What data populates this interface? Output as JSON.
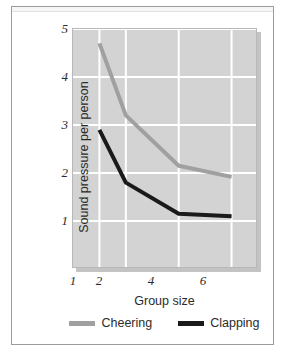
{
  "chart_data": {
    "type": "line",
    "title": "",
    "xlabel": "Group size",
    "ylabel": "Sound pressure per person",
    "x": [
      1,
      2,
      4,
      6
    ],
    "xtick_labels": [
      "1",
      "2",
      "4",
      "6"
    ],
    "ytick_labels": [
      "5",
      "4",
      "3",
      "2",
      "1"
    ],
    "xlim": [
      0,
      7
    ],
    "ylim": [
      0,
      5
    ],
    "grid": "both",
    "legend_position": "below-axes",
    "series": [
      {
        "name": "Cheering",
        "color": "#a0a0a0",
        "values": [
          4.7,
          3.2,
          2.15,
          1.92
        ]
      },
      {
        "name": "Clapping",
        "color": "#1a1a1a",
        "values": [
          2.9,
          1.8,
          1.15,
          1.1
        ]
      }
    ]
  },
  "axes": {
    "y_ticks": [
      {
        "label": "5",
        "value": 5
      },
      {
        "label": "4",
        "value": 4
      },
      {
        "label": "3",
        "value": 3
      },
      {
        "label": "2",
        "value": 2
      },
      {
        "label": "1",
        "value": 1
      }
    ],
    "x_ticks": [
      {
        "label": "1",
        "value": 1
      },
      {
        "label": "2",
        "value": 2
      },
      {
        "label": "4",
        "value": 4
      },
      {
        "label": "6",
        "value": 6
      }
    ],
    "x_title": "Group size",
    "y_title": "Sound pressure per person"
  },
  "legend": {
    "items": [
      {
        "label": "Cheering",
        "color": "#a0a0a0"
      },
      {
        "label": "Clapping",
        "color": "#1a1a1a"
      }
    ]
  },
  "colors": {
    "plot_background": "#d3d3d3",
    "gridline": "#ffffff",
    "frame_border": "#9b9b9b",
    "cheering": "#a0a0a0",
    "clapping": "#1a1a1a",
    "text": "#2b2b2b"
  }
}
